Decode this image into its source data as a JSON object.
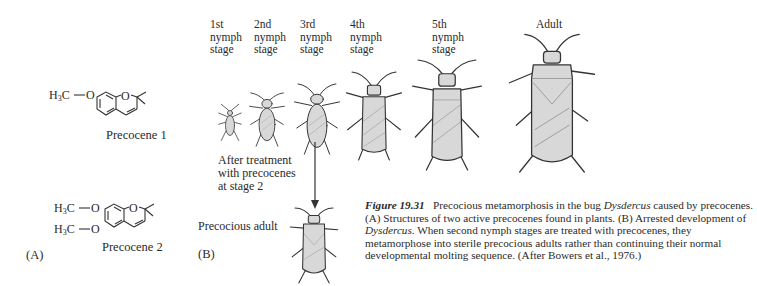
{
  "panel_a": {
    "label": "(A)",
    "compounds": [
      {
        "name": "Precocene 1",
        "substituents": [
          "H3C—O"
        ],
        "ring_atom": "O"
      },
      {
        "name": "Precocene 2",
        "substituents": [
          "H3C—O",
          "H3C—O"
        ],
        "ring_atom": "O"
      }
    ]
  },
  "panel_b": {
    "label": "(B)",
    "stages": [
      {
        "label": "1st\nnymph\nstage"
      },
      {
        "label": "2nd\nnymph\nstage"
      },
      {
        "label": "3rd\nnymph\nstage"
      },
      {
        "label": "4th\nnymph\nstage"
      },
      {
        "label": "5th\nnymph\nstage"
      },
      {
        "label": "Adult"
      }
    ],
    "treatment_note": "After treatment\nwith precocenes\nat stage 2",
    "precocious_label": "Precocious adult"
  },
  "caption": {
    "figure_number": "Figure 19.31",
    "text_1": "Precocious metamorphosis in the bug ",
    "genus_1": "Dysdercus",
    "text_2": " caused by precocenes. (A) Structures of two active precocenes found in plants. (B) Arrested development of ",
    "genus_2": "Dysdercus",
    "text_3": ". When second nymph stages are treated with precocenes, they metamorphose into sterile precocious adults rather than continuing their normal developmental molting sequence. (After Bowers et al., 1976.)"
  }
}
